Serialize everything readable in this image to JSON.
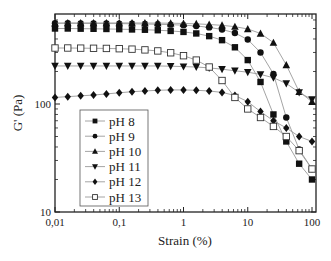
{
  "chart_data": {
    "type": "line",
    "title": "",
    "xlabel": "Strain (%)",
    "ylabel": "G' (Pa)",
    "xscale": "log",
    "yscale": "log",
    "xlim": [
      0.008,
      110
    ],
    "ylim": [
      10,
      680
    ],
    "xticks": [
      "0,01",
      "0,1",
      "1",
      "10",
      "100"
    ],
    "yticks": [
      "10",
      "100"
    ],
    "legend_position": "lower-left inside",
    "x": [
      0.01,
      0.0158,
      0.0251,
      0.0398,
      0.0631,
      0.1,
      0.158,
      0.251,
      0.398,
      0.631,
      1,
      1.58,
      2.51,
      3.98,
      6.31,
      10,
      15.8,
      25.1,
      39.8,
      63.1,
      100
    ],
    "series": [
      {
        "name": "pH 8",
        "marker": "filled-square",
        "values": [
          500,
          500,
          498,
          497,
          495,
          493,
          490,
          487,
          482,
          475,
          465,
          450,
          425,
          390,
          335,
          255,
          160,
          80,
          45,
          28,
          20
        ]
      },
      {
        "name": "pH 9",
        "marker": "filled-circle",
        "values": [
          560,
          560,
          558,
          557,
          556,
          555,
          553,
          550,
          547,
          543,
          537,
          528,
          512,
          490,
          455,
          395,
          300,
          190,
          75,
          38,
          25
        ]
      },
      {
        "name": "pH 10",
        "marker": "filled-triangle-up",
        "values": [
          560,
          562,
          562,
          563,
          563,
          563,
          563,
          562,
          561,
          560,
          557,
          552,
          545,
          535,
          520,
          495,
          450,
          370,
          230,
          130,
          105
        ]
      },
      {
        "name": "pH 11",
        "marker": "filled-triangle-down",
        "values": [
          225,
          225,
          225,
          225,
          225,
          225,
          225,
          225,
          225,
          224,
          222,
          220,
          216,
          210,
          203,
          197,
          188,
          175,
          155,
          128,
          110
        ]
      },
      {
        "name": "pH 12",
        "marker": "filled-diamond",
        "values": [
          115,
          117,
          119,
          121,
          124,
          127,
          130,
          132,
          134,
          135,
          135,
          134,
          132,
          128,
          120,
          105,
          85,
          70,
          60,
          50,
          45
        ]
      },
      {
        "name": "pH 13",
        "marker": "open-square",
        "values": [
          330,
          330,
          329,
          328,
          327,
          325,
          322,
          317,
          310,
          298,
          280,
          255,
          220,
          165,
          115,
          90,
          75,
          62,
          50,
          37,
          25
        ]
      }
    ]
  },
  "legend": {
    "items": [
      {
        "label": "pH 8"
      },
      {
        "label": "pH 9"
      },
      {
        "label": "pH 10"
      },
      {
        "label": "pH 11"
      },
      {
        "label": "pH 12"
      },
      {
        "label": "pH 13"
      }
    ]
  },
  "axes": {
    "xlabel": "Strain (%)",
    "ylabel": "G' (Pa)",
    "xtick_labels": [
      "0,01",
      "0,1",
      "1",
      "10",
      "100"
    ],
    "ytick_labels": [
      "10",
      "100"
    ]
  },
  "colors": {
    "line": "#9a9a9a",
    "marker": "#111111",
    "axis": "#222222"
  }
}
